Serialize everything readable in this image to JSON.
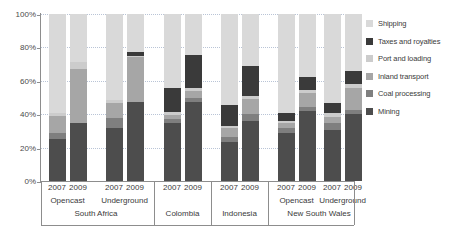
{
  "chart_data": {
    "type": "bar",
    "subtype": "stacked-percentage",
    "title": "",
    "xlabel": "",
    "ylabel": "",
    "ylim": [
      0,
      100
    ],
    "yticks": [
      0,
      20,
      40,
      60,
      80,
      100
    ],
    "ytick_labels": [
      "0%",
      "20%",
      "40%",
      "60%",
      "80%",
      "100%"
    ],
    "grid": true,
    "legend_position": "right",
    "units": "percent",
    "categories": [
      "South Africa Opencast 2007",
      "South Africa Opencast 2009",
      "South Africa Underground 2007",
      "South Africa Underground 2009",
      "Colombia 2007",
      "Colombia 2009",
      "Indonesia 2007",
      "Indonesia 2009",
      "New South Wales Opencast 2007",
      "New South Wales Opencast 2009",
      "New South Wales Underground 2007",
      "New South Wales Underground 2009"
    ],
    "series": [
      {
        "name": "Mining",
        "color": "#4d4d4d",
        "values": [
          25,
          34.5,
          32,
          47.5,
          34.5,
          47.5,
          23.5,
          36,
          29,
          42,
          30.5,
          40
        ]
      },
      {
        "name": "Coal processing",
        "color": "#7f7f7f",
        "values": [
          4,
          0,
          6,
          0,
          2.5,
          2.5,
          3,
          4,
          2.5,
          2.5,
          4,
          2.5
        ]
      },
      {
        "name": "Inland transport",
        "color": "#a6a6a6",
        "values": [
          10,
          32.5,
          9,
          26.5,
          2.5,
          4,
          5,
          9,
          3,
          8,
          4,
          13.5
        ]
      },
      {
        "name": "Port and loading",
        "color": "#cccccc",
        "values": [
          2,
          4,
          1.5,
          1,
          2,
          2,
          1.5,
          2,
          1.5,
          2,
          2,
          2
        ]
      },
      {
        "name": "Taxes and royalties",
        "color": "#3a3a3a",
        "values": [
          0,
          0,
          0,
          2,
          14,
          19.5,
          12.5,
          18,
          5,
          8,
          6,
          8
        ]
      },
      {
        "name": "Shipping",
        "color": "#d9d9d9",
        "values": [
          59,
          29,
          51.5,
          23,
          44.5,
          24.5,
          54.5,
          31,
          59,
          37.5,
          53.5,
          34
        ]
      }
    ],
    "legend_order": [
      "Shipping",
      "Taxes and royalties",
      "Port and loading",
      "Inland transport",
      "Coal processing",
      "Mining"
    ]
  },
  "legend": {
    "items": [
      {
        "label": "Shipping",
        "color": "#d9d9d9"
      },
      {
        "label": "Taxes and royalties",
        "color": "#3a3a3a"
      },
      {
        "label": "Port and loading",
        "color": "#cccccc"
      },
      {
        "label": "Inland transport",
        "color": "#a6a6a6"
      },
      {
        "label": "Coal processing",
        "color": "#7f7f7f"
      },
      {
        "label": "Mining",
        "color": "#4d4d4d"
      }
    ]
  },
  "axis": {
    "y_labels": [
      "100%",
      "80%",
      "60%",
      "40%",
      "20%",
      "0%"
    ]
  },
  "xaxis": {
    "years": [
      "2007",
      "2009",
      "2007",
      "2009",
      "2007",
      "2009",
      "2007",
      "2009",
      "2007",
      "2009",
      "2007",
      "2009"
    ],
    "mine_types": [
      {
        "label": "Opencast"
      },
      {
        "label": "Underground"
      },
      {
        "label": "Opencast"
      },
      {
        "label": "Underground"
      }
    ],
    "countries": [
      {
        "label": "South Africa"
      },
      {
        "label": "Colombia"
      },
      {
        "label": "Indonesia"
      },
      {
        "label": "New South Wales"
      }
    ]
  },
  "colors": {
    "axis": "#8d8d8d",
    "grid": "#b9c4d6",
    "text": "#3a3a3a",
    "background": "#ffffff"
  }
}
